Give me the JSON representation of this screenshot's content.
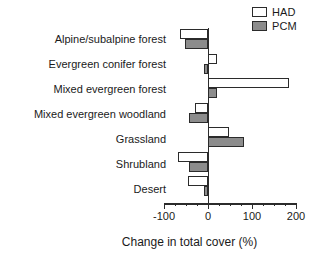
{
  "chart_data": {
    "type": "bar",
    "orientation": "horizontal",
    "title": "",
    "xlabel": "Change in total cover (%)",
    "ylabel": "",
    "xlim": [
      -100,
      200
    ],
    "xticks": [
      -100,
      0,
      100,
      200
    ],
    "xticklabels": [
      "-100",
      "0",
      "100",
      "200"
    ],
    "minor_tick_interval": 25,
    "grid": false,
    "legend_position": "top-right",
    "categories": [
      "Alpine/subalpine forest",
      "Evergreen conifer forest",
      "Mixed evergreen forest",
      "Mixed evergreen woodland",
      "Grassland",
      "Shrubland",
      "Desert"
    ],
    "series": [
      {
        "name": "HAD",
        "color": "#ffffff",
        "edgecolor": "#2b2b2b",
        "values": [
          -63,
          20,
          185,
          -30,
          48,
          -68,
          -45
        ]
      },
      {
        "name": "PCM",
        "color": "#8c8c8c",
        "edgecolor": "#2b2b2b",
        "values": [
          -52,
          -8,
          20,
          -43,
          82,
          -43,
          -10
        ]
      }
    ]
  },
  "legend": {
    "items": [
      {
        "label": "HAD",
        "swatch": "open-square-white"
      },
      {
        "label": "PCM",
        "swatch": "filled-square-gray"
      }
    ]
  },
  "axis": {
    "x_title": "Change in total cover (%)"
  }
}
